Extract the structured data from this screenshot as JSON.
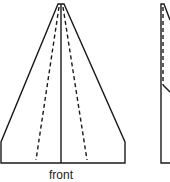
{
  "diagram": {
    "views": [
      {
        "name": "front-view",
        "label": "front",
        "outline_points": [
          [
            58,
            4
          ],
          [
            64,
            4
          ],
          [
            125,
            142
          ],
          [
            125,
            163
          ],
          [
            1,
            163
          ],
          [
            1,
            142
          ]
        ],
        "center_line": [
          [
            61,
            4
          ],
          [
            61,
            163
          ]
        ],
        "dashed_fold_lines": [
          [
            [
              59,
              7
            ],
            [
              36,
              160
            ]
          ],
          [
            [
              63,
              7
            ],
            [
              87,
              160
            ]
          ]
        ]
      },
      {
        "name": "side-view-partial",
        "label": "",
        "outline_points": [
          [
            170,
            20
          ],
          [
            164,
            4
          ],
          [
            161,
            4
          ],
          [
            161,
            163
          ],
          [
            170,
            163
          ]
        ],
        "dashed_fold_lines": [
          [
            [
              163,
              7
            ],
            [
              163,
              85
            ]
          ]
        ],
        "solid_segments": [
          [
            [
              163,
              85
            ],
            [
              170,
              92
            ]
          ]
        ]
      }
    ],
    "colors": {
      "stroke": "#1a1a1a",
      "background": "#ffffff",
      "label": "#222222"
    }
  }
}
